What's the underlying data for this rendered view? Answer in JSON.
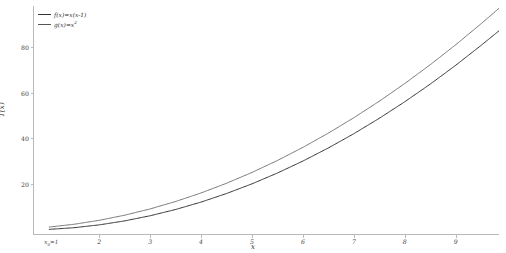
{
  "chart_data": {
    "type": "line",
    "title": "",
    "xlabel": "x",
    "ylabel": "T(x)",
    "xlim": [
      0.7,
      9.85
    ],
    "ylim": [
      -2,
      98
    ],
    "grid": false,
    "legend_position": "upper left",
    "x_ticks": [
      2,
      3,
      4,
      5,
      6,
      7,
      8,
      9
    ],
    "x_tick_labels": [
      "2",
      "3",
      "4",
      "5",
      "6",
      "7",
      "8",
      "9"
    ],
    "y_ticks": [
      20,
      40,
      60,
      80
    ],
    "y_tick_labels": [
      "20",
      "40",
      "60",
      "80"
    ],
    "origin_annotation": "x₀=1",
    "x": [
      1,
      1.5,
      2,
      2.5,
      3,
      3.5,
      4,
      4.5,
      5,
      5.5,
      6,
      6.5,
      7,
      7.5,
      8,
      8.5,
      9,
      9.5,
      9.7
    ],
    "series": [
      {
        "name": "f(x)=x·e⁽ˣ⁻¹⁾",
        "label": "f(x)=x(x-1)",
        "color": "#333333",
        "linewidth": 1.0,
        "values": [
          0,
          0.75,
          2,
          3.75,
          6,
          8.75,
          12,
          15.75,
          20,
          24.75,
          30,
          35.75,
          42,
          48.75,
          56,
          63.75,
          72,
          80.75,
          84.39
        ]
      },
      {
        "name": "g(x)=x²−x",
        "label": "g(x)=x²",
        "color": "#555555",
        "linewidth": 0.8,
        "values": [
          1,
          2.25,
          4,
          6.25,
          9,
          12.25,
          16,
          20.25,
          25,
          30.25,
          36,
          42.25,
          49,
          56.25,
          64,
          72.25,
          81,
          90.25,
          94.09
        ]
      }
    ]
  },
  "legend": {
    "entries": [
      {
        "label": "f(x)=x(x-1)",
        "color": "#333333"
      },
      {
        "label": "g(x)=x",
        "sup": "2",
        "color": "#555555"
      }
    ]
  },
  "axes": {
    "y_title": "T(x)",
    "x_title": "x",
    "origin_label": "x",
    "origin_sub": "0",
    "origin_eq": "=1"
  },
  "colors": {
    "background": "#ffffff",
    "spine": "#b9b9b9",
    "tick_text": "#3d3d3d",
    "series_1": "#333333",
    "series_2": "#555555"
  }
}
